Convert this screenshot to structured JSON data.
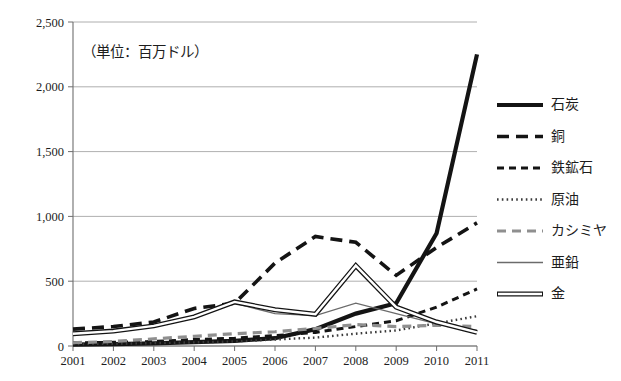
{
  "chart_data": {
    "type": "line",
    "title": "",
    "annotation": "（単位：百万ドル）",
    "xlabel": "",
    "ylabel": "",
    "x": [
      "2001",
      "2002",
      "2003",
      "2004",
      "2005",
      "2006",
      "2007",
      "2008",
      "2009",
      "2010",
      "2011"
    ],
    "categories": [
      "2001",
      "2002",
      "2003",
      "2004",
      "2005",
      "2006",
      "2007",
      "2008",
      "2009",
      "2010",
      "2011"
    ],
    "ylim": [
      0,
      2500
    ],
    "yticks": [
      "0",
      "500",
      "1,000",
      "1,500",
      "2,000",
      "2,500"
    ],
    "ytick_values": [
      0,
      500,
      1000,
      1500,
      2000,
      2500
    ],
    "grid": "horizontal",
    "legend_position": "right",
    "series": [
      {
        "name": "石炭",
        "style": "thick-solid",
        "color": "#141414",
        "values": [
          10,
          15,
          20,
          30,
          40,
          60,
          130,
          250,
          330,
          870,
          2250
        ]
      },
      {
        "name": "銅",
        "style": "long-dash",
        "color": "#141414",
        "values": [
          130,
          150,
          185,
          290,
          330,
          640,
          845,
          800,
          545,
          760,
          950
        ]
      },
      {
        "name": "鉄鉱石",
        "style": "medium-dash",
        "color": "#141414",
        "values": [
          25,
          28,
          35,
          50,
          60,
          80,
          105,
          150,
          195,
          300,
          440
        ]
      },
      {
        "name": "原油",
        "style": "dotted",
        "color": "#3a3a3a",
        "values": [
          15,
          18,
          22,
          28,
          35,
          50,
          65,
          95,
          120,
          175,
          230
        ]
      },
      {
        "name": "カシミヤ",
        "style": "gray-dash",
        "color": "#8f8f8f",
        "values": [
          25,
          35,
          55,
          75,
          95,
          110,
          135,
          165,
          150,
          160,
          150
        ]
      },
      {
        "name": "亜鉛",
        "style": "thin-solid",
        "color": "#6b6b6b",
        "values": [
          95,
          110,
          150,
          215,
          330,
          250,
          235,
          330,
          250,
          170,
          120
        ]
      },
      {
        "name": "金",
        "style": "hollow-double",
        "color": "#141414",
        "values": [
          95,
          115,
          155,
          225,
          340,
          280,
          245,
          620,
          300,
          185,
          105
        ]
      }
    ]
  },
  "legend": {
    "items": [
      {
        "label": "石炭",
        "style": "thick-solid"
      },
      {
        "label": "銅",
        "style": "long-dash"
      },
      {
        "label": "鉄鉱石",
        "style": "medium-dash"
      },
      {
        "label": "原油",
        "style": "dotted"
      },
      {
        "label": "カシミヤ",
        "style": "gray-dash"
      },
      {
        "label": "亜鉛",
        "style": "thin-solid"
      },
      {
        "label": "金",
        "style": "hollow-double"
      }
    ]
  },
  "colors": {
    "axis": "#6e6e6e",
    "grid": "#9b9b9b",
    "text": "#1d1d1d",
    "dark_series": "#141414",
    "gray_series": "#8f8f8f"
  }
}
